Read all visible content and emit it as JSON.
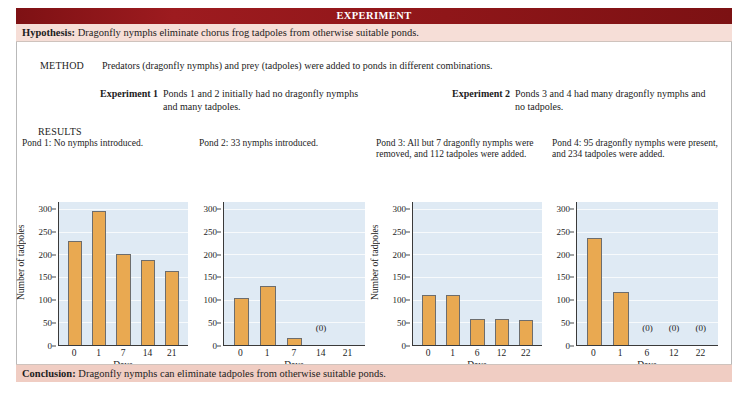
{
  "banner": {
    "title": "EXPERIMENT"
  },
  "hypothesis": {
    "label": "Hypothesis:",
    "text": " Dragonfly nymphs eliminate chorus frog tadpoles from otherwise suitable ponds."
  },
  "method": {
    "label": "METHOD",
    "text": "Predators (dragonfly nymphs) and prey (tadpoles) were added to ponds in different combinations."
  },
  "experiments": [
    {
      "label": "Experiment 1",
      "text": "Ponds 1 and 2 initially had no dragonfly nymphs and many tadpoles."
    },
    {
      "label": "Experiment 2",
      "text": "Ponds 3 and 4 had many dragonfly nymphs and no tadpoles."
    }
  ],
  "results": {
    "label": "RESULTS"
  },
  "conclusion": {
    "label": "Conclusion:",
    "text": " Dragonfly nymphs can eliminate tadpoles from otherwise suitable ponds."
  },
  "colors": {
    "banner_red": "#8f1619",
    "hypothesis_pink": "#f6ded7",
    "conclusion_pink": "#f0cdc3",
    "bar_orange": "#e9a951",
    "plot_background": "#dfeaf4",
    "axis": "#3a3a3a"
  },
  "chart_data": [
    {
      "type": "bar",
      "title": "Pond 1: No nymphs introduced.",
      "xlabel": "Days",
      "ylabel": "Number of tadpoles",
      "show_ylabel": true,
      "categories": [
        "0",
        "1",
        "7",
        "14",
        "21"
      ],
      "values": [
        230,
        296,
        201,
        188,
        163
      ],
      "zero_labels": [],
      "yticks": [
        0,
        50,
        100,
        150,
        200,
        250,
        300
      ],
      "ylim": [
        0,
        315
      ],
      "grid": true
    },
    {
      "type": "bar",
      "title": "Pond 2: 33 nymphs introduced.",
      "xlabel": "Days",
      "ylabel": "Number of tadpoles",
      "show_ylabel": false,
      "categories": [
        "0",
        "1",
        "7",
        "14",
        "21"
      ],
      "values": [
        103,
        131,
        16,
        0,
        0
      ],
      "zero_labels": [
        {
          "index": 3,
          "text": "(0)"
        }
      ],
      "yticks": [
        0,
        50,
        100,
        150,
        200,
        250,
        300
      ],
      "ylim": [
        0,
        315
      ],
      "grid": true
    },
    {
      "type": "bar",
      "title": "Pond 3: All but 7 dragonfly nymphs were removed, and 112 tadpoles were added.",
      "xlabel": "Days",
      "ylabel": "Number of tadpoles",
      "show_ylabel": true,
      "categories": [
        "0",
        "1",
        "6",
        "12",
        "22"
      ],
      "values": [
        111,
        111,
        57,
        57,
        55
      ],
      "zero_labels": [],
      "yticks": [
        0,
        50,
        100,
        150,
        200,
        250,
        300
      ],
      "ylim": [
        0,
        315
      ],
      "grid": true
    },
    {
      "type": "bar",
      "title": "Pond 4: 95 dragonfly nymphs were present, and 234 tadpoles were added.",
      "xlabel": "Days",
      "ylabel": "Number of tadpoles",
      "show_ylabel": false,
      "categories": [
        "0",
        "1",
        "6",
        "12",
        "22"
      ],
      "values": [
        236,
        117,
        0,
        0,
        0
      ],
      "zero_labels": [
        {
          "index": 2,
          "text": "(0)"
        },
        {
          "index": 3,
          "text": "(0)"
        },
        {
          "index": 4,
          "text": "(0)"
        }
      ],
      "yticks": [
        0,
        50,
        100,
        150,
        200,
        250,
        300
      ],
      "ylim": [
        0,
        315
      ],
      "grid": true
    }
  ]
}
